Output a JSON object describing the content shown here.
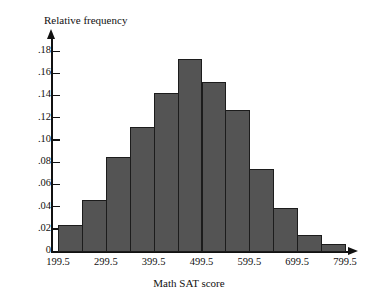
{
  "chart_data": {
    "type": "bar",
    "title": "",
    "xlabel": "Math SAT score",
    "ylabel": "Relative frequency",
    "grid": false,
    "legend": null,
    "xlim": [
      199.5,
      799.5
    ],
    "ylim": [
      0,
      0.19
    ],
    "bin_width": 50,
    "x_tick_labels": [
      "199.5",
      "299.5",
      "399.5",
      "499.5",
      "599.5",
      "699.5",
      "799.5"
    ],
    "x_tick_values": [
      199.5,
      299.5,
      399.5,
      499.5,
      599.5,
      699.5,
      799.5
    ],
    "y_tick_labels": [
      "0",
      ".02",
      ".04",
      ".06",
      ".08",
      ".10",
      ".12",
      ".14",
      ".16",
      ".18"
    ],
    "y_tick_values": [
      0,
      0.02,
      0.04,
      0.06,
      0.08,
      0.1,
      0.12,
      0.14,
      0.16,
      0.18
    ],
    "bin_edges": [
      199.5,
      249.5,
      299.5,
      349.5,
      399.5,
      449.5,
      499.5,
      549.5,
      599.5,
      649.5,
      699.5,
      749.5,
      799.5
    ],
    "categories": [
      "199.5-249.5",
      "249.5-299.5",
      "299.5-349.5",
      "349.5-399.5",
      "399.5-449.5",
      "449.5-499.5",
      "499.5-549.5",
      "549.5-599.5",
      "599.5-649.5",
      "649.5-699.5",
      "699.5-749.5",
      "749.5-799.5"
    ],
    "values": [
      0.023,
      0.046,
      0.085,
      0.112,
      0.142,
      0.173,
      0.152,
      0.127,
      0.074,
      0.039,
      0.014,
      0.006
    ]
  },
  "colors": {
    "bar_fill": "#545454",
    "bar_stroke": "#1c1c1c",
    "axis": "#111111",
    "background": "#ffffff"
  }
}
